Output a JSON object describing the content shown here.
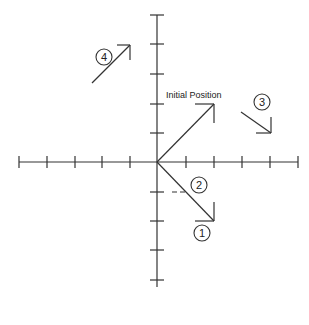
{
  "diagram": {
    "origin": {
      "x": 157,
      "y": 162
    },
    "tick_spacing_px": 28,
    "x_axis": {
      "ticks": [
        -5,
        -4,
        -3,
        -2,
        -1,
        0,
        1,
        2,
        3,
        4,
        5
      ]
    },
    "y_axis": {
      "ticks": [
        5,
        4,
        3,
        2,
        1,
        0,
        -1,
        -2,
        -3,
        -4
      ]
    },
    "stroke_color": "#333333",
    "labels": {
      "initial": "Initial Position",
      "c1": "1",
      "c2": "2",
      "c3": "3",
      "c4": "4"
    },
    "vectors": [
      {
        "name": "initial-position",
        "from": [
          0,
          0
        ],
        "to": [
          2,
          2
        ]
      },
      {
        "name": "position-1",
        "from": [
          0,
          0
        ],
        "to": [
          2,
          -2
        ]
      },
      {
        "name": "position-2",
        "from": [
          0,
          0
        ],
        "to": [
          1,
          -1
        ]
      },
      {
        "name": "position-3",
        "from": [
          3,
          1.8
        ],
        "to": [
          4,
          1
        ]
      },
      {
        "name": "position-4",
        "from": [
          -2.3,
          2.8
        ],
        "to": [
          -1,
          4.2
        ]
      }
    ]
  }
}
